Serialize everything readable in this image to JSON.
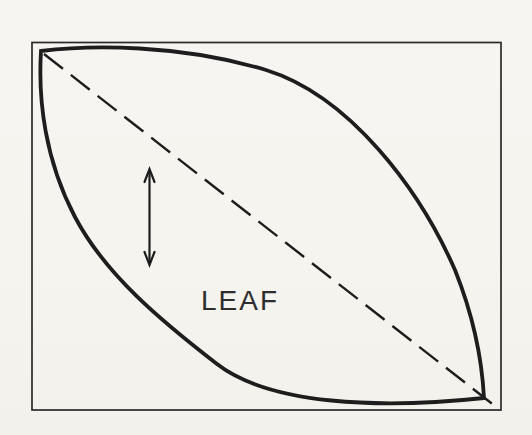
{
  "figure": {
    "label": "LEAF",
    "colors": {
      "paper": "#f5f4f0",
      "ink": "#1d1d1d",
      "frame": "#2a2a2a",
      "text": "#2e2e2e"
    }
  }
}
